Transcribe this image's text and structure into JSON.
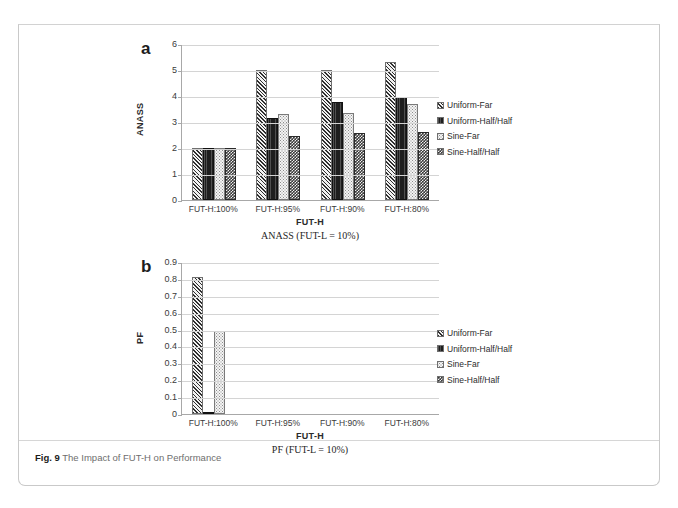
{
  "figure": {
    "number_label": "Fig. 9",
    "caption": "The Impact of FUT-H on Performance"
  },
  "panels": [
    {
      "letter": "a",
      "sub_caption": "ANASS (FUT-L = 10%)",
      "xaxis_title": "FUT-H",
      "yaxis_title": "ANASS"
    },
    {
      "letter": "b",
      "sub_caption": "PF (FUT-L = 10%)",
      "xaxis_title": "FUT-H",
      "yaxis_title": "PF"
    }
  ],
  "legend": {
    "items": [
      {
        "label": "Uniform-Far",
        "swatch": "diagonal-hatch-swatch",
        "color": "#2e2e2e"
      },
      {
        "label": "Uniform-Half/Half",
        "swatch": "solid-dark-swatch",
        "color": "#1e1e1e"
      },
      {
        "label": "Sine-Far",
        "swatch": "light-dotted-swatch",
        "color": "#f4f4f4"
      },
      {
        "label": "Sine-Half/Half",
        "swatch": "dark-checker-swatch",
        "color": "#3a3a3a"
      }
    ]
  },
  "chart_data": [
    {
      "type": "bar",
      "title": "ANASS (FUT-L = 10%)",
      "panel": "a",
      "xlabel": "FUT-H",
      "ylabel": "ANASS",
      "ylim": [
        0,
        6
      ],
      "yticks": [
        0,
        1,
        2,
        3,
        4,
        5,
        6
      ],
      "ytick_labels": [
        "0",
        "1",
        "2",
        "3",
        "4",
        "5",
        "6"
      ],
      "grid": true,
      "legend_position": "right",
      "categories": [
        "FUT-H:100%",
        "FUT-H:95%",
        "FUT-H:90%",
        "FUT-H:80%"
      ],
      "series": [
        {
          "name": "Uniform-Far",
          "values": [
            2.0,
            5.0,
            5.0,
            5.3
          ]
        },
        {
          "name": "Uniform-Half/Half",
          "values": [
            2.0,
            3.15,
            3.77,
            3.95
          ]
        },
        {
          "name": "Sine-Far",
          "values": [
            2.0,
            3.3,
            3.33,
            3.7
          ]
        },
        {
          "name": "Sine-Half/Half",
          "values": [
            2.0,
            2.48,
            2.58,
            2.63
          ]
        }
      ]
    },
    {
      "type": "bar",
      "title": "PF (FUT-L = 10%)",
      "panel": "b",
      "xlabel": "FUT-H",
      "ylabel": "PF",
      "ylim": [
        0,
        0.9
      ],
      "yticks": [
        0,
        0.1,
        0.2,
        0.3,
        0.4,
        0.5,
        0.6,
        0.7,
        0.8,
        0.9
      ],
      "ytick_labels": [
        "0",
        "0.1",
        "0.2",
        "0.3",
        "0.4",
        "0.5",
        "0.6",
        "0.7",
        "0.8",
        "0.9"
      ],
      "grid": true,
      "legend_position": "right",
      "categories": [
        "FUT-H:100%",
        "FUT-H:95%",
        "FUT-H:90%",
        "FUT-H:80%"
      ],
      "series": [
        {
          "name": "Uniform-Far",
          "values": [
            0.81,
            0,
            0,
            0
          ]
        },
        {
          "name": "Uniform-Half/Half",
          "values": [
            0.01,
            0,
            0,
            0
          ]
        },
        {
          "name": "Sine-Far",
          "values": [
            0.49,
            0,
            0,
            0
          ]
        },
        {
          "name": "Sine-Half/Half",
          "values": [
            0,
            0,
            0,
            0
          ]
        }
      ]
    }
  ]
}
